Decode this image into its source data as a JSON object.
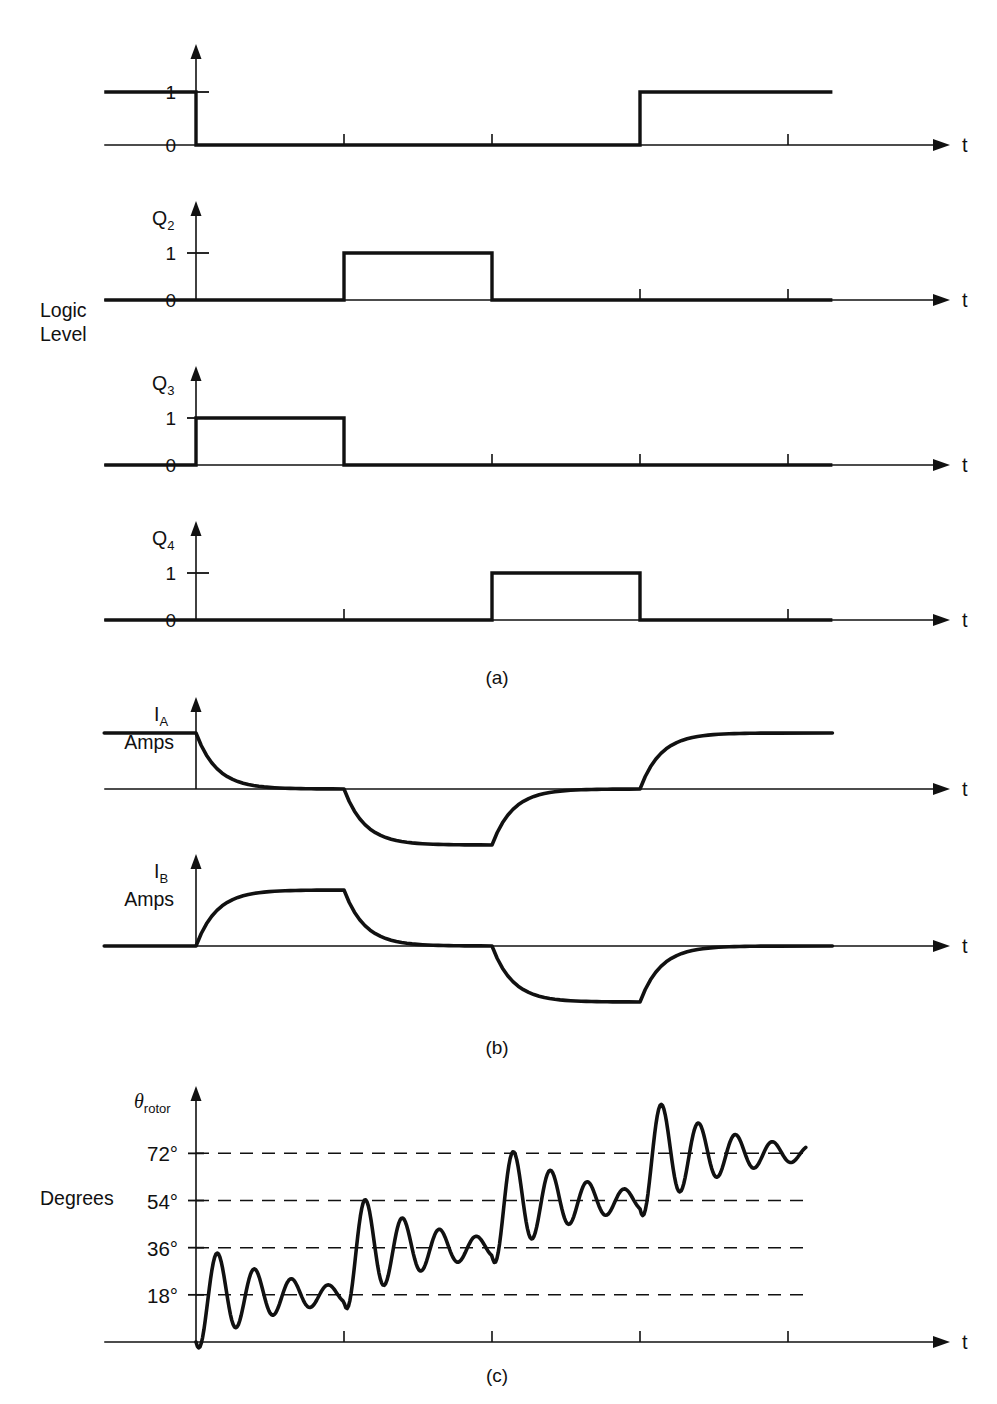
{
  "figure": {
    "title_implicit": "Stepper motor drive logic, phase currents and rotor angle response",
    "axis_time_label": "t",
    "side_labels": {
      "logic_level_line1": "Logic",
      "logic_level_line2": "Level",
      "degrees": "Degrees"
    },
    "captions": {
      "a": "(a)",
      "b": "(b)",
      "c": "(c)"
    }
  },
  "chart_data": {
    "type": "line",
    "xlabel": "t",
    "ylabel": "Logic Level / Amps / Degrees",
    "grid": false,
    "legend_position": "none",
    "step_boundaries": [
      0,
      1,
      2,
      3,
      4
    ],
    "tick_labels": [
      "",
      "",
      "",
      "",
      ""
    ],
    "panels": [
      {
        "id": "a",
        "caption": "(a)",
        "group_label": "Logic Level",
        "ylabel": "Logic Level",
        "signals": [
          {
            "name": "Q1",
            "label": "",
            "label_sub": "",
            "y_ticks": [
              "1",
              "0"
            ],
            "ylim": [
              0,
              1
            ],
            "type": "digital",
            "segments": [
              {
                "from": -0.62,
                "to": 0.0,
                "value": 1
              },
              {
                "from": 0.0,
                "to": 3.0,
                "value": 0
              },
              {
                "from": 3.0,
                "to": 4.3,
                "value": 1
              }
            ]
          },
          {
            "name": "Q2",
            "label": "Q",
            "label_sub": "2",
            "y_ticks": [
              "1",
              "0"
            ],
            "ylim": [
              0,
              1
            ],
            "type": "digital",
            "segments": [
              {
                "from": -0.62,
                "to": 1.0,
                "value": 0
              },
              {
                "from": 1.0,
                "to": 2.0,
                "value": 1
              },
              {
                "from": 2.0,
                "to": 4.3,
                "value": 0
              }
            ]
          },
          {
            "name": "Q3",
            "label": "Q",
            "label_sub": "3",
            "y_ticks": [
              "1",
              "0"
            ],
            "ylim": [
              0,
              1
            ],
            "type": "digital",
            "segments": [
              {
                "from": -0.62,
                "to": 0.0,
                "value": 0
              },
              {
                "from": 0.0,
                "to": 1.0,
                "value": 1
              },
              {
                "from": 1.0,
                "to": 4.3,
                "value": 0
              }
            ]
          },
          {
            "name": "Q4",
            "label": "Q",
            "label_sub": "4",
            "y_ticks": [
              "1",
              "0"
            ],
            "ylim": [
              0,
              1
            ],
            "type": "digital",
            "segments": [
              {
                "from": -0.62,
                "to": 2.0,
                "value": 0
              },
              {
                "from": 2.0,
                "to": 3.0,
                "value": 1
              },
              {
                "from": 3.0,
                "to": 4.3,
                "value": 0
              }
            ]
          }
        ]
      },
      {
        "id": "b",
        "caption": "(b)",
        "ylabel": "Amps",
        "signals": [
          {
            "name": "IA",
            "label": "I",
            "label_sub": "A",
            "units": "Amps",
            "type": "exponential",
            "ylim": [
              -1,
              1
            ],
            "levels": [
              {
                "from": -0.62,
                "to": 0.0,
                "value": 1
              },
              {
                "from": 0.0,
                "to": 1.0,
                "value": 0
              },
              {
                "from": 1.0,
                "to": 2.0,
                "value": -1
              },
              {
                "from": 2.0,
                "to": 3.0,
                "value": 0
              },
              {
                "from": 3.0,
                "to": 4.3,
                "value": 1
              }
            ]
          },
          {
            "name": "IB",
            "label": "I",
            "label_sub": "B",
            "units": "Amps",
            "type": "exponential",
            "ylim": [
              -1,
              1
            ],
            "levels": [
              {
                "from": -0.62,
                "to": 0.0,
                "value": 0
              },
              {
                "from": 0.0,
                "to": 1.0,
                "value": 1
              },
              {
                "from": 1.0,
                "to": 2.0,
                "value": 0
              },
              {
                "from": 2.0,
                "to": 3.0,
                "value": -1
              },
              {
                "from": 3.0,
                "to": 4.3,
                "value": 0
              }
            ]
          }
        ]
      },
      {
        "id": "c",
        "caption": "(c)",
        "ylabel": "Degrees",
        "signals": [
          {
            "name": "theta_rotor",
            "label": "θ",
            "label_sub": "rotor",
            "type": "damped_step",
            "ylim": [
              0,
              84
            ],
            "y_ticks": [
              "18°",
              "36°",
              "54°",
              "72°"
            ],
            "y_tick_values": [
              18,
              36,
              54,
              72
            ],
            "dashed_gridlines": [
              18,
              36,
              54,
              72
            ],
            "steps": [
              {
                "start_time": 0.0,
                "target": 18
              },
              {
                "start_time": 1.0,
                "target": 36
              },
              {
                "start_time": 2.0,
                "target": 54
              },
              {
                "start_time": 3.0,
                "target": 72
              }
            ],
            "overshoot_fraction": 0.42,
            "oscillation_cycles_per_step": 4,
            "damping": 0.52
          }
        ]
      }
    ]
  },
  "colors": {
    "ink": "#111111",
    "background": "#ffffff",
    "axis": "#111111"
  }
}
